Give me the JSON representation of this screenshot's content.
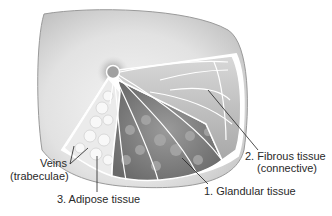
{
  "diagram": {
    "labels": {
      "glandular": "1. Glandular tissue",
      "fibrous": "2. Fibrous tissue",
      "fibrous_sub": "(connective)",
      "adipose": "3. Adipose tissue",
      "veins": "Veins",
      "veins_sub": "(trabeculae)"
    },
    "colors": {
      "skin": "#d6d6d6",
      "skin_light": "#f2f2f2",
      "glandular": "#7d7d7d",
      "adipose": "#e6e6e6",
      "fibrous": "#bdbdbd",
      "outline": "#ffffff",
      "leader": "#222222"
    }
  }
}
